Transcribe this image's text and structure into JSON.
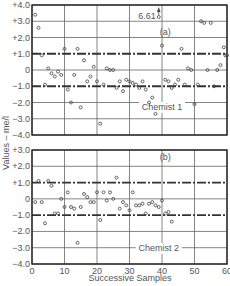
{
  "chart_data": [
    {
      "type": "scatter",
      "panel_label": "(a)",
      "annotation_label": "Chemist 1",
      "outlier_annotation": {
        "x": 39,
        "value": 6.61,
        "label": "6.61",
        "marker": "arrow-up"
      },
      "xlabel": "Successive Samples",
      "ylabel": "Values – me/l",
      "xlim": [
        0,
        60
      ],
      "ylim": [
        -4.0,
        4.0
      ],
      "x_ticks": [
        0,
        10,
        20,
        30,
        40,
        50,
        60
      ],
      "y_ticks": [
        "+4.0",
        "+3.0",
        "+2.0",
        "+1.0",
        "0",
        "−1.0",
        "−2.0",
        "−3.0",
        "−4.0"
      ],
      "grid": true,
      "control_limits": [
        1.0,
        -1.0
      ],
      "points": [
        [
          1,
          3.4
        ],
        [
          2,
          2.6
        ],
        [
          3,
          0.9
        ],
        [
          4,
          -0.9
        ],
        [
          5,
          0.1
        ],
        [
          6,
          -0.2
        ],
        [
          7,
          -0.4
        ],
        [
          8,
          -0.1
        ],
        [
          9,
          -0.3
        ],
        [
          10,
          1.3
        ],
        [
          11,
          -1.2
        ],
        [
          12,
          -2.0
        ],
        [
          13,
          -0.3
        ],
        [
          14,
          1.3
        ],
        [
          15,
          -2.3
        ],
        [
          16,
          0.6
        ],
        [
          17,
          -0.7
        ],
        [
          18,
          -0.4
        ],
        [
          19,
          0.2
        ],
        [
          20,
          -0.7
        ],
        [
          21,
          -3.3
        ],
        [
          22,
          -0.9
        ],
        [
          23,
          0.1
        ],
        [
          24,
          0.0
        ],
        [
          25,
          0.0
        ],
        [
          26,
          -1.1
        ],
        [
          27,
          -0.7
        ],
        [
          28,
          -1.3
        ],
        [
          29,
          -0.6
        ],
        [
          30,
          -0.7
        ],
        [
          31,
          -0.8
        ],
        [
          32,
          -0.9
        ],
        [
          33,
          -1.1
        ],
        [
          34,
          -0.7
        ],
        [
          35,
          -1.2
        ],
        [
          36,
          -2.0
        ],
        [
          37,
          -1.7
        ],
        [
          38,
          -2.7
        ],
        [
          39,
          6.61
        ],
        [
          40,
          1.5
        ],
        [
          41,
          -0.6
        ],
        [
          42,
          -0.7
        ],
        [
          43,
          -1.1
        ],
        [
          44,
          -0.9
        ],
        [
          45,
          -0.6
        ],
        [
          46,
          1.3
        ],
        [
          47,
          -0.9
        ],
        [
          48,
          0.1
        ],
        [
          49,
          0.0
        ],
        [
          50,
          -2.1
        ],
        [
          51,
          -0.9
        ],
        [
          52,
          3.0
        ],
        [
          53,
          2.9
        ],
        [
          54,
          0.0
        ],
        [
          55,
          2.9
        ],
        [
          56,
          -1.0
        ],
        [
          57,
          0.0
        ],
        [
          58,
          0.3
        ],
        [
          59,
          1.4
        ],
        [
          59.5,
          0.9
        ],
        [
          60,
          0.9
        ]
      ]
    },
    {
      "type": "scatter",
      "panel_label": "(b)",
      "annotation_label": "Chemist 2",
      "xlabel": "Successive Samples",
      "ylabel": "Values – me/l",
      "xlim": [
        0,
        60
      ],
      "ylim": [
        -4.0,
        3.0
      ],
      "x_ticks": [
        0,
        10,
        20,
        30,
        40,
        50,
        60
      ],
      "y_ticks": [
        "+3.0",
        "+2.0",
        "+1.0",
        "0",
        "−1.0",
        "−2.0",
        "−3.0",
        "−4.0"
      ],
      "grid": true,
      "control_limits": [
        1.0,
        -1.0
      ],
      "points": [
        [
          1,
          -0.2
        ],
        [
          2,
          1.1
        ],
        [
          3,
          -0.2
        ],
        [
          4,
          -1.5
        ],
        [
          5,
          1.1
        ],
        [
          6,
          0.8
        ],
        [
          7,
          -0.9
        ],
        [
          8,
          -0.9
        ],
        [
          9,
          0.0
        ],
        [
          10,
          -0.5
        ],
        [
          11,
          0.4
        ],
        [
          12,
          -0.5
        ],
        [
          13,
          -0.6
        ],
        [
          14,
          -2.7
        ],
        [
          15,
          -0.5
        ],
        [
          16,
          0.3
        ],
        [
          17,
          0.1
        ],
        [
          18,
          -0.2
        ],
        [
          19,
          -0.2
        ],
        [
          20,
          0.4
        ],
        [
          21,
          -1.3
        ],
        [
          22,
          0.4
        ],
        [
          23,
          -0.1
        ],
        [
          24,
          0.4
        ],
        [
          25,
          0.0
        ],
        [
          26,
          1.3
        ],
        [
          27,
          -0.6
        ],
        [
          28,
          -0.2
        ],
        [
          29,
          -0.4
        ],
        [
          30,
          -0.7
        ],
        [
          31,
          0.4
        ],
        [
          32,
          -0.4
        ],
        [
          33,
          -0.4
        ],
        [
          34,
          -0.3
        ],
        [
          35,
          -0.9
        ],
        [
          36,
          -0.3
        ],
        [
          37,
          -0.2
        ],
        [
          38,
          -0.4
        ],
        [
          39,
          -0.5
        ],
        [
          40,
          -0.1
        ],
        [
          41,
          -0.9
        ],
        [
          42,
          -0.8
        ],
        [
          43,
          -1.4
        ]
      ]
    }
  ],
  "labels": {
    "x_axis_title": "Successive Samples",
    "y_axis_title": "Values – me/l",
    "panel_a": "(a)",
    "panel_b": "(b)",
    "chemist_1": "Chemist 1",
    "chemist_2": "Chemist 2",
    "outlier": "6.61"
  },
  "colors": {
    "axis": "#222222",
    "grid": "#666666",
    "limit_line": "#333333",
    "marker": "#444444",
    "text": "#555555"
  }
}
